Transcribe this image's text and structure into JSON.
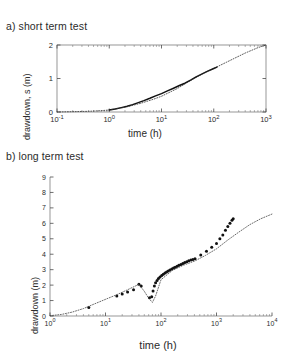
{
  "page": {
    "ghost_top_text": "",
    "background": "#ffffff",
    "ink": "#1a1a1a"
  },
  "panels": [
    {
      "id": "panel-a",
      "title": "a) short term test"
    },
    {
      "id": "panel-b",
      "title": "b) long term test"
    }
  ],
  "chart_data": [
    {
      "type": "line",
      "id": "short-term-test",
      "title": "a) short term test",
      "xlabel": "time (h)",
      "ylabel": "drawdown, s (m)",
      "xscale": "log",
      "yscale": "linear",
      "xlim": [
        0.1,
        1000
      ],
      "ylim": [
        0,
        2
      ],
      "xticks": [
        0.1,
        1,
        10,
        100,
        1000
      ],
      "xticklabels": [
        "10^-1",
        "10^0",
        "10^1",
        "10^2",
        "10^3"
      ],
      "yticks": [
        0,
        1,
        2
      ],
      "yticklabels": [
        "0",
        "1",
        "2"
      ],
      "grid": false,
      "legend": "none",
      "series": [
        {
          "name": "measured drawdown",
          "style": "solid",
          "color": "#111111",
          "x": [
            1.0,
            1.3,
            1.7,
            2.2,
            2.8,
            3.6,
            4.6,
            6.0,
            7.7,
            10.0,
            13.0,
            17.0,
            22.0,
            28.0,
            36.0,
            46.0,
            60.0,
            77.0,
            100.0,
            115.0
          ],
          "y": [
            0.06,
            0.09,
            0.13,
            0.17,
            0.22,
            0.28,
            0.34,
            0.41,
            0.48,
            0.55,
            0.63,
            0.71,
            0.79,
            0.86,
            0.95,
            1.05,
            1.14,
            1.22,
            1.3,
            1.34
          ]
        },
        {
          "name": "fitted / extrapolated model",
          "style": "dotted",
          "color": "#333333",
          "x": [
            0.1,
            0.2,
            0.4,
            0.7,
            1.0,
            2.0,
            4.0,
            7.0,
            10.0,
            20.0,
            40.0,
            70.0,
            100.0,
            200.0,
            400.0,
            700.0,
            1000.0
          ],
          "y": [
            0.0,
            0.01,
            0.02,
            0.04,
            0.06,
            0.14,
            0.26,
            0.38,
            0.47,
            0.7,
            0.98,
            1.19,
            1.3,
            1.53,
            1.76,
            1.92,
            2.0
          ]
        }
      ]
    },
    {
      "type": "scatter",
      "id": "long-term-test",
      "title": "b) long term test",
      "xlabel": "time (h)",
      "ylabel": "drawdown (m)",
      "xscale": "log",
      "yscale": "linear",
      "xlim": [
        1,
        10000
      ],
      "ylim": [
        0,
        9
      ],
      "xticks": [
        1,
        10,
        100,
        1000,
        10000
      ],
      "xticklabels": [
        "10^0",
        "10^1",
        "10^2",
        "10^3",
        "10^4"
      ],
      "yticks": [
        0,
        1,
        2,
        3,
        4,
        5,
        6,
        7,
        8,
        9
      ],
      "yticklabels": [
        "0",
        "1",
        "2",
        "3",
        "4",
        "5",
        "6",
        "7",
        "8",
        "9"
      ],
      "grid": false,
      "legend": "none",
      "series": [
        {
          "name": "measured drawdown",
          "style": "markers",
          "marker": "filled-circle",
          "color": "#111111",
          "x": [
            5.0,
            16.0,
            20.0,
            25.0,
            32.0,
            40.0,
            44.0,
            62.0,
            68.0,
            72.0,
            76.0,
            80.0,
            85.0,
            90.0,
            96.0,
            103.0,
            110.0,
            118.0,
            126.0,
            135.0,
            145.0,
            156.0,
            168.0,
            180.0,
            195.0,
            210.0,
            228.0,
            247.0,
            268.0,
            291.0,
            316.0,
            345.0,
            375.0,
            410.0,
            520.0,
            660.0,
            820.0,
            1000.0,
            1150.0,
            1300.0,
            1450.0,
            1600.0,
            1750.0,
            1900.0,
            2000.0
          ],
          "y": [
            0.55,
            1.3,
            1.42,
            1.55,
            1.7,
            2.05,
            1.95,
            1.18,
            1.25,
            1.62,
            1.95,
            2.15,
            2.3,
            2.42,
            2.52,
            2.62,
            2.7,
            2.78,
            2.85,
            2.92,
            2.98,
            3.04,
            3.1,
            3.16,
            3.22,
            3.28,
            3.34,
            3.4,
            3.46,
            3.52,
            3.58,
            3.62,
            3.66,
            3.7,
            3.95,
            4.2,
            4.45,
            4.7,
            5.0,
            5.25,
            5.55,
            5.8,
            6.0,
            6.2,
            6.3
          ]
        },
        {
          "name": "fitted / extrapolated model",
          "style": "dotted",
          "color": "#444444",
          "x": [
            1.0,
            1.6,
            2.5,
            4.0,
            6.3,
            10.0,
            16.0,
            25.0,
            40.0,
            50.0,
            60.0,
            70.0,
            80.0,
            100.0,
            160.0,
            250.0,
            400.0,
            630.0,
            1000.0,
            1600.0,
            2500.0,
            4000.0,
            6300.0,
            10000.0
          ],
          "y": [
            0.02,
            0.1,
            0.25,
            0.48,
            0.78,
            1.08,
            1.38,
            1.7,
            2.05,
            1.6,
            1.15,
            0.88,
            1.3,
            2.35,
            2.95,
            3.28,
            3.55,
            3.92,
            4.35,
            4.92,
            5.42,
            5.92,
            6.3,
            6.6
          ]
        }
      ]
    }
  ]
}
